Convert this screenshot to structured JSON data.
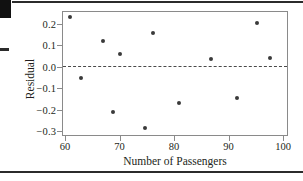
{
  "chart_data": {
    "type": "scatter",
    "title": "",
    "xlabel": "Number of Passengers",
    "ylabel": "Residual",
    "xlim": [
      58,
      102
    ],
    "ylim": [
      -0.32,
      0.25
    ],
    "xticks": [
      "60",
      "70",
      "80",
      "90",
      "100"
    ],
    "xtick_values": [
      60,
      70,
      80,
      90,
      100
    ],
    "yticks": [
      "0.2",
      "0.1",
      "0.0",
      "−0.1",
      "−0.2",
      "−0.3"
    ],
    "ytick_values": [
      0.2,
      0.1,
      0.0,
      -0.1,
      -0.2,
      -0.3
    ],
    "grid": false,
    "legend": "none",
    "reference_line": {
      "y": 0.0,
      "style": "dashed",
      "color": "#4a4a4a"
    },
    "marker": {
      "shape": "circle",
      "color": "#3a3a3a",
      "size": 4
    },
    "x": [
      61.0,
      62.9,
      67.0,
      68.8,
      70.0,
      74.6,
      76.2,
      81.0,
      86.7,
      91.6,
      95.3,
      97.6
    ],
    "y": [
      0.232,
      -0.053,
      0.122,
      -0.211,
      0.059,
      -0.285,
      0.158,
      -0.168,
      0.038,
      -0.147,
      0.205,
      0.042
    ],
    "points": [
      {
        "x": 61.0,
        "y": 0.232
      },
      {
        "x": 62.9,
        "y": -0.053
      },
      {
        "x": 67.0,
        "y": 0.122
      },
      {
        "x": 68.8,
        "y": -0.211
      },
      {
        "x": 70.0,
        "y": 0.059
      },
      {
        "x": 74.6,
        "y": -0.285
      },
      {
        "x": 76.2,
        "y": 0.158
      },
      {
        "x": 81.0,
        "y": -0.168
      },
      {
        "x": 86.7,
        "y": 0.038
      },
      {
        "x": 91.6,
        "y": -0.147
      },
      {
        "x": 95.3,
        "y": 0.205
      },
      {
        "x": 97.6,
        "y": 0.042
      }
    ]
  },
  "figure": {
    "axis_color": "#8a8a8a",
    "text_color": "#231f20"
  }
}
